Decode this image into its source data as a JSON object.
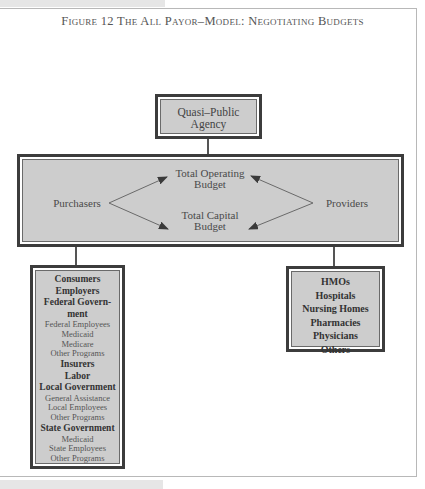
{
  "figure": {
    "title": "Figure 12  The All Payor–Model: Negotiating Budgets"
  },
  "agency": {
    "line1": "Quasi–Public",
    "line2": "Agency"
  },
  "main": {
    "purchasers": "Purchasers",
    "providers": "Providers",
    "operating_line1": "Total Operating",
    "operating_line2": "Budget",
    "capital_line1": "Total Capital",
    "capital_line2": "Budget"
  },
  "purchasers_list": [
    {
      "type": "h",
      "text": "Consumers"
    },
    {
      "type": "h",
      "text": "Employers"
    },
    {
      "type": "h",
      "text": "Federal Govern-"
    },
    {
      "type": "h",
      "text": "ment"
    },
    {
      "type": "s",
      "text": "Federal Employees"
    },
    {
      "type": "s",
      "text": "Medicaid"
    },
    {
      "type": "s",
      "text": "Medicare"
    },
    {
      "type": "s",
      "text": "Other Programs"
    },
    {
      "type": "h",
      "text": "Insurers"
    },
    {
      "type": "h",
      "text": "Labor"
    },
    {
      "type": "h",
      "text": "Local Government"
    },
    {
      "type": "s",
      "text": "General Assistance"
    },
    {
      "type": "s",
      "text": "Local Employees"
    },
    {
      "type": "s",
      "text": "Other Programs"
    },
    {
      "type": "h",
      "text": "State Government"
    },
    {
      "type": "s",
      "text": "Medicaid"
    },
    {
      "type": "s",
      "text": "State Employees"
    },
    {
      "type": "s",
      "text": "Other Programs"
    }
  ],
  "providers_list": [
    "HMOs",
    "Hospitals",
    "Nursing Homes",
    "Pharmacies",
    "Physicians",
    "Others"
  ]
}
